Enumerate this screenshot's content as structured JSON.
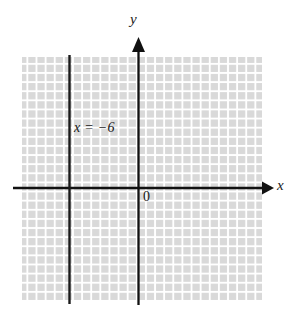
{
  "figure": {
    "type": "coordinate-plane-graph",
    "width": 296,
    "height": 313,
    "background_color": "#ffffff"
  },
  "labels": {
    "y_axis": "y",
    "x_axis": "x",
    "origin": "0",
    "equation": "x = −6"
  },
  "chart_data": {
    "type": "line",
    "title": "",
    "subtitle": "",
    "xlabel": "x",
    "ylabel": "y",
    "grid": true,
    "legend_position": "none",
    "annotations": [
      {
        "text": "x = −6",
        "x": -5.5,
        "y": 6.5
      },
      {
        "text": "0",
        "x": 0.7,
        "y": -0.9
      }
    ],
    "series": [
      {
        "name": "x = −6",
        "equation": "x = -6",
        "orientation": "vertical",
        "x_intercept": -6,
        "points": [
          {
            "x": -6,
            "y": -12.5
          },
          {
            "x": -6,
            "y": 14.5
          }
        ],
        "color": "#1a1a1a",
        "line_width": 2.4
      }
    ],
    "axes": {
      "x_axis": {
        "position_y": 0,
        "arrow": "right",
        "color": "#111111",
        "xlim": [
          -13.8,
          14.7
        ]
      },
      "y_axis": {
        "position_x": 0,
        "arrow": "up",
        "color": "#111111",
        "ylim": [
          -12.9,
          16.5
        ]
      }
    },
    "grid_region": {
      "x_range": [
        -12.8,
        13.6
      ],
      "y_range": [
        -12.4,
        14.4
      ],
      "cell_size_units": 1,
      "cell_color": "#d9d9d9",
      "gap_color": "#ffffff"
    }
  },
  "geometry": {
    "grid": {
      "left": 22,
      "top": 57,
      "right": 262,
      "bottom": 301,
      "cell": 9.12,
      "cols": 26,
      "rows": 27
    },
    "x_axis": {
      "y": 188,
      "x_start": 13,
      "x_end": 268,
      "arrow_tip": 274
    },
    "y_axis": {
      "x": 138.5,
      "y_start": 305,
      "y_end": 46,
      "arrow_tip": 37
    },
    "vline": {
      "x": 69.5,
      "y_start": 55,
      "y_end": 304
    }
  },
  "colors": {
    "grid_cell": "#d9d9d9",
    "grid_gap": "#ffffff",
    "axis": "#111111",
    "line": "#1a1a1a",
    "text": "#1a1a1a",
    "background": "#ffffff"
  }
}
